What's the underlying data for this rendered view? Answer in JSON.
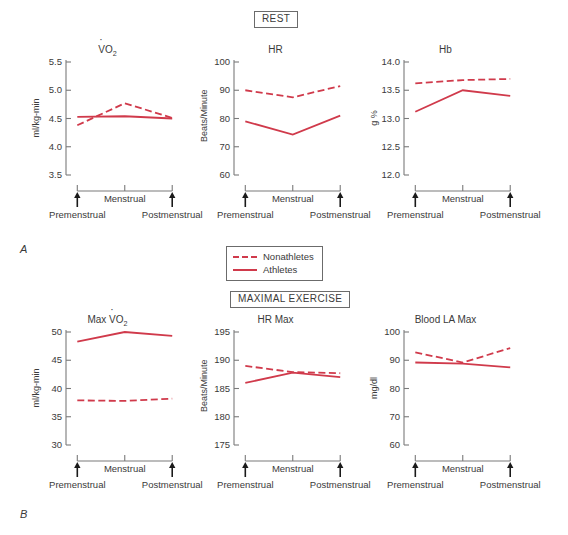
{
  "figure": {
    "sections": [
      {
        "id": "rest",
        "label": "REST",
        "panel_letter": "A"
      },
      {
        "id": "maximal",
        "label": "MAXIMAL EXERCISE",
        "panel_letter": "B"
      }
    ],
    "legend": {
      "items": [
        {
          "label": "Nonathletes",
          "style": "dashed",
          "color": "#D03A4B"
        },
        {
          "label": "Athletes",
          "style": "solid",
          "color": "#D03A4B"
        }
      ]
    },
    "axis_labels": {
      "premenstrual": "Premenstrual",
      "menstrual": "Menstrual",
      "postmenstrual": "Postmenstrual"
    },
    "colors": {
      "line": "#D03A4B",
      "axis": "#7a7a7a",
      "text": "#3a3a3a"
    }
  },
  "chart_data": [
    {
      "type": "line",
      "id": "vo2-rest",
      "title": "VO2",
      "title_parts": {
        "pre": "V",
        "dot": true,
        "main": "O",
        "sub": "2"
      },
      "xlabel": "",
      "ylabel": "ml/kg-min",
      "categories": [
        "Premenstrual",
        "Menstrual",
        "Postmenstrual"
      ],
      "ylim": [
        3.5,
        5.5
      ],
      "yticks": [
        "5.5",
        "5.0",
        "4.5",
        "4.0",
        "3.5"
      ],
      "ytick_values": [
        5.5,
        5.0,
        4.5,
        4.0,
        3.5
      ],
      "grid": false,
      "series": [
        {
          "name": "Nonathletes",
          "style": "dashed",
          "values": [
            4.38,
            4.77,
            4.51
          ]
        },
        {
          "name": "Athletes",
          "style": "solid",
          "values": [
            4.53,
            4.54,
            4.5
          ]
        }
      ]
    },
    {
      "type": "line",
      "id": "hr-rest",
      "title": "HR",
      "xlabel": "",
      "ylabel": "Beats/Minute",
      "categories": [
        "Premenstrual",
        "Menstrual",
        "Postmenstrual"
      ],
      "ylim": [
        60,
        100
      ],
      "yticks": [
        "100",
        "90",
        "80",
        "70",
        "60"
      ],
      "ytick_values": [
        100,
        90,
        80,
        70,
        60
      ],
      "grid": false,
      "series": [
        {
          "name": "Nonathletes",
          "style": "dashed",
          "values": [
            90.0,
            87.5,
            91.5
          ]
        },
        {
          "name": "Athletes",
          "style": "solid",
          "values": [
            79.0,
            74.3,
            81.0
          ]
        }
      ]
    },
    {
      "type": "line",
      "id": "hb-rest",
      "title": "Hb",
      "xlabel": "",
      "ylabel": "g %",
      "categories": [
        "Premenstrual",
        "Menstrual",
        "Postmenstrual"
      ],
      "ylim": [
        12.0,
        14.0
      ],
      "yticks": [
        "14.0",
        "13.5",
        "13.0",
        "12.5",
        "12.0"
      ],
      "ytick_values": [
        14.0,
        13.5,
        13.0,
        12.5,
        12.0
      ],
      "grid": false,
      "series": [
        {
          "name": "Nonathletes",
          "style": "dashed",
          "values": [
            13.62,
            13.68,
            13.7
          ]
        },
        {
          "name": "Athletes",
          "style": "solid",
          "values": [
            13.12,
            13.5,
            13.4
          ]
        }
      ]
    },
    {
      "type": "line",
      "id": "maxvo2",
      "title": "Max VO2",
      "title_parts": {
        "pre": "Max V",
        "dot": true,
        "main": "O",
        "sub": "2"
      },
      "xlabel": "",
      "ylabel": "ml/kg-min",
      "categories": [
        "Premenstrual",
        "Menstrual",
        "Postmenstrual"
      ],
      "ylim": [
        30,
        50
      ],
      "yticks": [
        "50",
        "45",
        "40",
        "35",
        "30"
      ],
      "ytick_values": [
        50,
        45,
        40,
        35,
        30
      ],
      "grid": false,
      "series": [
        {
          "name": "Nonathletes",
          "style": "dashed",
          "values": [
            37.9,
            37.8,
            38.2
          ]
        },
        {
          "name": "Athletes",
          "style": "solid",
          "values": [
            48.3,
            50.0,
            49.3
          ]
        }
      ]
    },
    {
      "type": "line",
      "id": "hrmax",
      "title": "HR Max",
      "xlabel": "",
      "ylabel": "Beats/Minute",
      "categories": [
        "Premenstrual",
        "Menstrual",
        "Postmenstrual"
      ],
      "ylim": [
        175,
        195
      ],
      "yticks": [
        "195",
        "190",
        "185",
        "180",
        "175"
      ],
      "ytick_values": [
        195,
        190,
        185,
        180,
        175
      ],
      "grid": false,
      "series": [
        {
          "name": "Nonathletes",
          "style": "dashed",
          "values": [
            189.0,
            187.9,
            187.7
          ]
        },
        {
          "name": "Athletes",
          "style": "solid",
          "values": [
            186.0,
            187.8,
            187.0
          ]
        }
      ]
    },
    {
      "type": "line",
      "id": "bloodlamax",
      "title": "Blood LA Max",
      "xlabel": "",
      "ylabel": "mg/dl",
      "categories": [
        "Premenstrual",
        "Menstrual",
        "Postmenstrual"
      ],
      "ylim": [
        60,
        100
      ],
      "yticks": [
        "100",
        "90",
        "80",
        "70",
        "60"
      ],
      "ytick_values": [
        100,
        90,
        80,
        70,
        60
      ],
      "grid": false,
      "series": [
        {
          "name": "Nonathletes",
          "style": "dashed",
          "values": [
            92.8,
            89.2,
            94.3
          ]
        },
        {
          "name": "Athletes",
          "style": "solid",
          "values": [
            89.2,
            88.8,
            87.5
          ]
        }
      ]
    }
  ]
}
